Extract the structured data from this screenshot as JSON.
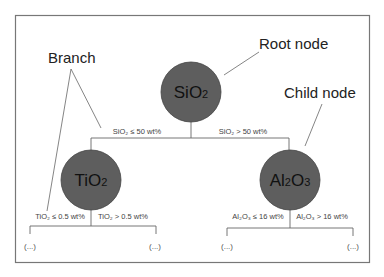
{
  "callouts": {
    "branch": "Branch",
    "root_node": "Root node",
    "child_node": "Child node"
  },
  "root": {
    "label": "SiO",
    "sub": "2",
    "left_condition": "SiO₂ ≤ 50 wt%",
    "right_condition": "SiO₂ > 50 wt%"
  },
  "left_child": {
    "label": "TiO",
    "sub": "2",
    "left_condition": "TiO₂ ≤ 0.5 wt%",
    "right_condition": "TiO₂ > 0.5 wt%",
    "left_leaf": "(...)",
    "right_leaf": "(...)"
  },
  "right_child": {
    "label_a": "Al",
    "sub_a": "2",
    "label_b": "O",
    "sub_b": "3",
    "left_condition": "Al₂O₃ ≤ 16 wt%",
    "right_condition": "Al₂O₃ > 16 wt%",
    "left_leaf": "(...)",
    "right_leaf": "(...)"
  },
  "colors": {
    "node_fill": "#5e5e5e",
    "frame": "#777777",
    "line": "#666666"
  }
}
